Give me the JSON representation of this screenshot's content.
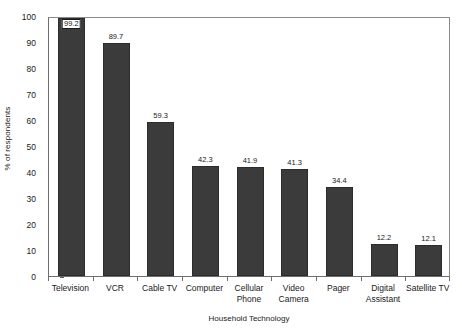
{
  "chart_data": {
    "type": "bar",
    "title": "",
    "xlabel": "Household Technology",
    "ylabel": "% of respondents",
    "ylim": [
      0,
      100
    ],
    "yticks": [
      0,
      10,
      20,
      30,
      40,
      50,
      60,
      70,
      80,
      90,
      100
    ],
    "grid": false,
    "legend": null,
    "bar_color": "#3b3b3b",
    "categories": [
      "Television",
      "VCR",
      "Cable TV",
      "Computer",
      "Cellular\nPhone",
      "Video\nCamera",
      "Pager",
      "Digital\nAssistant",
      "Satellite TV"
    ],
    "values": [
      99.2,
      89.7,
      59.3,
      42.3,
      41.9,
      41.3,
      34.4,
      12.2,
      12.1
    ],
    "value_labels": [
      "99.2",
      "89.7",
      "59.3",
      "42.3",
      "41.9",
      "41.3",
      "34.4",
      "12.2",
      "12.1"
    ],
    "first_label_boxed": true
  },
  "axis": {
    "y_title": "% of respondents",
    "x_title": "Household Technology",
    "y_tick_labels": [
      "100",
      "90",
      "80",
      "70",
      "60",
      "50",
      "40",
      "30",
      "20",
      "10",
      "0"
    ]
  }
}
